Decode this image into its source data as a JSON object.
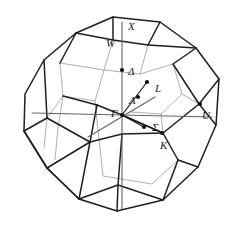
{
  "figure": {
    "kind": "brillouin-zone-diagram",
    "shape": "truncated-octahedron",
    "lattice": "face-centered-cubic",
    "background_color": "#ffffff",
    "outline_color": "#1b1b1b",
    "hidden_edge_color": "#8d8d8d",
    "axis_color": "#5a5a5a",
    "point_color": "#111111"
  },
  "labels": {
    "X": "X",
    "W": "W",
    "Delta": "Δ",
    "L": "L",
    "Lambda": "Λ",
    "Gamma": "Γ",
    "U": "U",
    "Sigma": "Σ",
    "K": "K"
  },
  "symmetry_points": [
    {
      "name": "X",
      "label": "X",
      "x": 128,
      "y": 21,
      "dot": false
    },
    {
      "name": "W",
      "label": "W",
      "x": 106,
      "y": 38,
      "dot": false
    },
    {
      "name": "Delta",
      "label": "Δ",
      "x": 128,
      "y": 66,
      "dot": true,
      "dot_x": 122,
      "dot_y": 70
    },
    {
      "name": "L",
      "label": "L",
      "x": 155,
      "y": 83,
      "dot": true,
      "dot_x": 147,
      "dot_y": 82
    },
    {
      "name": "Lambda",
      "label": "Λ",
      "x": 129,
      "y": 95,
      "dot": true,
      "dot_x": 138,
      "dot_y": 97
    },
    {
      "name": "Gamma",
      "label": "Γ",
      "x": 111,
      "y": 108,
      "dot": true,
      "dot_x": 122,
      "dot_y": 115
    },
    {
      "name": "U",
      "label": "U",
      "x": 202,
      "y": 110,
      "dot": true,
      "dot_x": 200,
      "dot_y": 104
    },
    {
      "name": "Sigma",
      "label": "Σ",
      "x": 152,
      "y": 122,
      "dot": true,
      "dot_x": 144,
      "dot_y": 127
    },
    {
      "name": "K",
      "label": "K",
      "x": 160,
      "y": 140,
      "dot": true,
      "dot_x": 162,
      "dot_y": 133
    }
  ]
}
